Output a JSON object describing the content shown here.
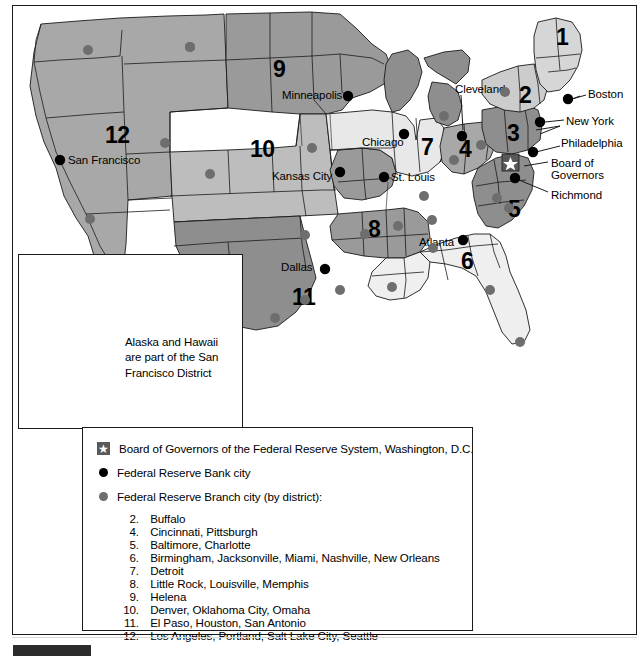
{
  "colors": {
    "district_dark": "#8e8e8e",
    "district_mid": "#a8a8a8",
    "district_light": "#c9c9c9",
    "district_pale": "#e8e8e8",
    "branch_dot": "#6e6e6e",
    "bank_dot": "#000000",
    "star_box": "#595959",
    "outline": "#1a1a1a"
  },
  "map": {
    "district_numbers": [
      {
        "n": "1",
        "x": 556,
        "y": 38
      },
      {
        "n": "2",
        "x": 519,
        "y": 92
      },
      {
        "n": "3",
        "x": 511,
        "y": 125
      },
      {
        "n": "4",
        "x": 461,
        "y": 140
      },
      {
        "n": "5",
        "x": 511,
        "y": 200
      },
      {
        "n": "6",
        "x": 464,
        "y": 252
      },
      {
        "n": "7",
        "x": 423,
        "y": 140
      },
      {
        "n": "8",
        "x": 371,
        "y": 222
      },
      {
        "n": "9",
        "x": 276,
        "y": 62
      },
      {
        "n": "10",
        "x": 256,
        "y": 142
      },
      {
        "n": "11",
        "x": 299,
        "y": 289
      },
      {
        "n": "12",
        "x": 113,
        "y": 128
      }
    ],
    "bank_cities": [
      {
        "name": "Boston",
        "label_x": 588,
        "label_y": 93,
        "dot_x": 568,
        "dot_y": 99
      },
      {
        "name": "New York",
        "label_x": 568,
        "label_y": 122,
        "dot_x": 541,
        "dot_y": 122
      },
      {
        "name": "Philadelphia",
        "label_x": 563,
        "label_y": 143,
        "dot_x": 533,
        "dot_y": 152
      },
      {
        "name": "Board of",
        "label_x": 551,
        "label_y": 163,
        "dot_x": 0,
        "dot_y": 0
      },
      {
        "name": "Governors",
        "label_x": 551,
        "label_y": 174,
        "dot_x": 0,
        "dot_y": 0
      },
      {
        "name": "Richmond",
        "label_x": 551,
        "label_y": 195,
        "dot_x": 515,
        "dot_y": 178
      },
      {
        "name": "Cleveland",
        "label_x": 455,
        "label_y": 89,
        "dot_x": 462,
        "dot_y": 135
      },
      {
        "name": "Chicago",
        "label_x": 362,
        "label_y": 142,
        "dot_x": 404,
        "dot_y": 134
      },
      {
        "name": "St. Louis",
        "label_x": 391,
        "label_y": 177,
        "dot_x": 383,
        "dot_y": 177
      },
      {
        "name": "Minneapolis",
        "label_x": 282,
        "label_y": 94,
        "dot_x": 347,
        "dot_y": 96
      },
      {
        "name": "Kansas City",
        "label_x": 272,
        "label_y": 176,
        "dot_x": 340,
        "dot_y": 172
      },
      {
        "name": "Dallas",
        "label_x": 281,
        "label_y": 266,
        "dot_x": 324,
        "dot_y": 270
      },
      {
        "name": "Atlanta",
        "label_x": 419,
        "label_y": 242,
        "dot_x": 462,
        "dot_y": 240
      },
      {
        "name": "San Francisco",
        "label_x": 68,
        "label_y": 159,
        "dot_x": 60,
        "dot_y": 160
      }
    ],
    "board_star": {
      "x": 509,
      "y": 161
    }
  },
  "inset": {
    "note_line1": "Alaska and Hawaii",
    "note_line2": "are part of the San",
    "note_line3": "Francisco District"
  },
  "legend": {
    "board_label": "Board of Governors of the Federal Reserve System, Washington, D.C.",
    "bank_label": "Federal Reserve Bank city",
    "branch_label": "Federal Reserve Branch city (by district):",
    "star_icon": "star-icon",
    "bank_dot_icon": "black-dot-icon",
    "branch_dot_icon": "gray-dot-icon",
    "branches": [
      {
        "num": "2.",
        "cities": "Buffalo"
      },
      {
        "num": "4.",
        "cities": "Cincinnati, Pittsburgh"
      },
      {
        "num": "5.",
        "cities": "Baltimore, Charlotte"
      },
      {
        "num": "6.",
        "cities": "Birmingham, Jacksonville, Miami, Nashville, New Orleans"
      },
      {
        "num": "7.",
        "cities": "Detroit"
      },
      {
        "num": "8.",
        "cities": "Little Rock, Louisville, Memphis"
      },
      {
        "num": "9.",
        "cities": "Helena"
      },
      {
        "num": "10.",
        "cities": "Denver, Oklahoma City, Omaha"
      },
      {
        "num": "11.",
        "cities": "El Paso, Houston, San Antonio"
      },
      {
        "num": "12.",
        "cities": "Los Angeles, Portland, Salt Lake City, Seattle"
      }
    ]
  }
}
